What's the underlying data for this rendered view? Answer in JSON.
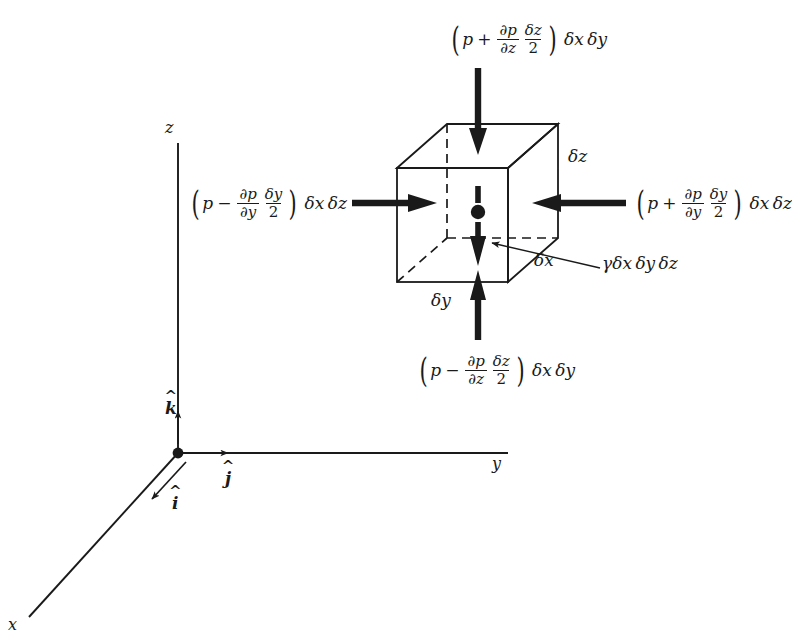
{
  "figure": {
    "type": "free-body-diagram",
    "background": "#ffffff",
    "ink": "#1a1a1a"
  },
  "axes": {
    "z_label": "z",
    "y_label": "y",
    "x_label": "x",
    "origin_dot": "origin-dot",
    "unit_vectors": [
      {
        "name": "k-hat",
        "symbol": "k",
        "hat": "^",
        "direction": "up"
      },
      {
        "name": "j-hat",
        "symbol": "j",
        "hat": "^",
        "direction": "right"
      },
      {
        "name": "i-hat",
        "symbol": "i",
        "hat": "^",
        "direction": "down-left"
      }
    ]
  },
  "element": {
    "center_dot": "element-center-dot",
    "edges": {
      "dz": {
        "delta": "δ",
        "var": "z"
      },
      "dx": {
        "delta": "δ",
        "var": "x"
      },
      "dy": {
        "delta": "δ",
        "var": "y"
      }
    }
  },
  "forces": {
    "top": {
      "name": "top-pressure-force",
      "sign": "+",
      "p": "p",
      "partial_num": "∂p",
      "partial_den": "∂z",
      "delta_num": "δz",
      "delta_den": "2",
      "area": "δx δy",
      "direction": "down"
    },
    "bottom": {
      "name": "bottom-pressure-force",
      "sign": "−",
      "p": "p",
      "partial_num": "∂p",
      "partial_den": "∂z",
      "delta_num": "δz",
      "delta_den": "2",
      "area": "δx δy",
      "direction": "up"
    },
    "left": {
      "name": "left-pressure-force",
      "sign": "−",
      "p": "p",
      "partial_num": "∂p",
      "partial_den": "∂y",
      "delta_num": "δy",
      "delta_den": "2",
      "area": "δx δz",
      "direction": "right"
    },
    "right": {
      "name": "right-pressure-force",
      "sign": "+",
      "p": "p",
      "partial_num": "∂p",
      "partial_den": "∂y",
      "delta_num": "δy",
      "delta_den": "2",
      "area": "δx δz",
      "direction": "left"
    },
    "weight": {
      "name": "weight-force",
      "gamma": "γ",
      "volume": "δx δy δz",
      "direction": "down"
    }
  }
}
